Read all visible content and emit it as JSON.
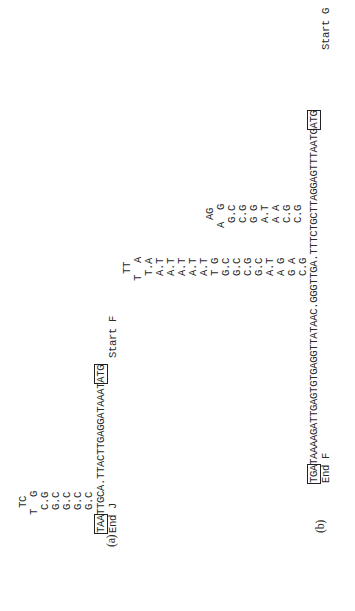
{
  "figure": {
    "panel_a": {
      "label": "(a)",
      "hairpin1": {
        "loop_top": "TC",
        "loop_side": "T  G",
        "stem": [
          "C.G",
          "G.C",
          "G.C",
          "G.C",
          "G.C"
        ]
      },
      "sequence": {
        "boxed_start": "TAA",
        "middle": "TTGCA.TTACTTGAGGATAAAT",
        "boxed_end": "ATG"
      },
      "end_label": "End J",
      "start_label": "Start F",
      "hairpin2": {
        "loop_top": "TT",
        "loop_side": "T  A",
        "stem": [
          "T.A",
          "A.T",
          "A.T",
          "A.T",
          "A.T",
          "A.T"
        ]
      }
    },
    "panel_b": {
      "label": "(b)",
      "sequence": {
        "boxed_start": "TGA",
        "middle": "TAAAAGATTGAGTGTGAGGTTATAAC.GGGTTGA.TTTCTGCTTAGGAGTTTAATG",
        "boxed_end": "ATG"
      },
      "end_label": "End F",
      "start_label": "Start G",
      "hairpin1": {
        "stem": [
          "A.T",
          "A.T",
          "T G",
          "G.C",
          "G.C",
          "C.G",
          "G.C",
          "A.T",
          "A G",
          "G A",
          "C.G"
        ]
      },
      "hairpin2": {
        "loop_top": "AG",
        "loop_side": "A  G",
        "stem": [
          "G.C",
          "C.G",
          "G G",
          "A.T",
          "A A",
          "C.G",
          "C.G"
        ]
      }
    }
  }
}
